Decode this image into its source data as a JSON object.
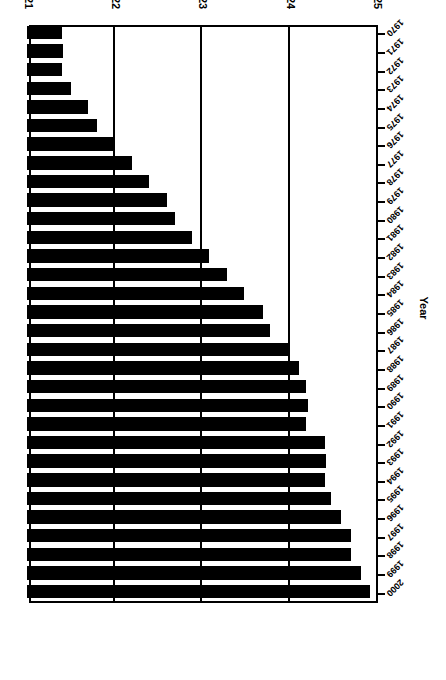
{
  "chart_data": {
    "type": "bar",
    "orientation": "horizontal",
    "title": "",
    "xlabel": "Mean Age of Mother",
    "ylabel": "Year",
    "xlim": [
      21,
      25
    ],
    "xticks": [
      "25",
      "24",
      "23",
      "22",
      "21"
    ],
    "xtick_values": [
      25,
      24,
      23,
      22,
      21
    ],
    "grid": true,
    "legend": false,
    "legend_position": "none",
    "bar_color": "#000000",
    "background_color": "#ffffff",
    "axis_color": "#000000",
    "rotation_note": "figure rendered rotated 180 degrees",
    "categories": [
      "2000",
      "1999",
      "1998",
      "1997",
      "1996",
      "1995",
      "1994",
      "1993",
      "1992",
      "1991",
      "1990",
      "1989",
      "1988",
      "1987",
      "1986",
      "1985",
      "1984",
      "1983",
      "1982",
      "1981",
      "1980",
      "1979",
      "1978",
      "1977",
      "1976",
      "1975",
      "1974",
      "1973",
      "1972",
      "1971",
      "1970"
    ],
    "values": [
      24.93,
      24.83,
      24.71,
      24.71,
      24.6,
      24.48,
      24.42,
      24.43,
      24.42,
      24.2,
      24.22,
      24.2,
      24.12,
      24.0,
      23.79,
      23.7,
      23.49,
      23.29,
      23.09,
      22.89,
      22.7,
      22.6,
      22.4,
      22.2,
      22.0,
      21.8,
      21.7,
      21.5,
      21.4,
      21.41,
      21.4
    ]
  }
}
